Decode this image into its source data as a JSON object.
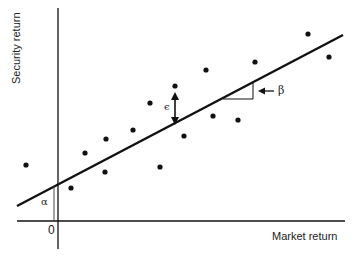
{
  "diagram": {
    "axes": {
      "x_label": "Market return",
      "y_label": "Security return",
      "origin_label": "0"
    },
    "annotations": {
      "alpha": "α",
      "beta": "β",
      "epsilon": "ϵ"
    },
    "colors": {
      "ink": "#111111",
      "background": "#ffffff"
    },
    "points": [
      {
        "x": 26,
        "y": 165
      },
      {
        "x": 71,
        "y": 188
      },
      {
        "x": 85,
        "y": 153
      },
      {
        "x": 105,
        "y": 172
      },
      {
        "x": 106,
        "y": 139
      },
      {
        "x": 133,
        "y": 130
      },
      {
        "x": 150,
        "y": 103
      },
      {
        "x": 160,
        "y": 167
      },
      {
        "x": 175,
        "y": 86
      },
      {
        "x": 184,
        "y": 136
      },
      {
        "x": 206,
        "y": 70
      },
      {
        "x": 213,
        "y": 116
      },
      {
        "x": 238,
        "y": 120
      },
      {
        "x": 255,
        "y": 62
      },
      {
        "x": 308,
        "y": 34
      },
      {
        "x": 329,
        "y": 57
      }
    ],
    "regression_line": {
      "x1": 17,
      "y1": 206,
      "x2": 343,
      "y2": 35
    }
  }
}
